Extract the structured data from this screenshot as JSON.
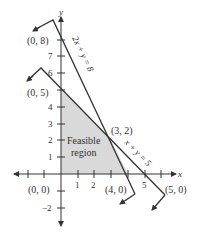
{
  "figure": {
    "axes": {
      "x_label": "x",
      "y_label": "y",
      "x_ticks": [
        "1",
        "2",
        "5"
      ],
      "y_ticks": [
        "−2",
        "1",
        "2",
        "3",
        "4",
        "6",
        "7"
      ]
    },
    "lines": [
      {
        "equation": "2x + y = 8",
        "intercepts": [
          "(0, 8)",
          "(4, 0)"
        ]
      },
      {
        "equation": "x + y = 5",
        "intercepts": [
          "(0, 5)",
          "(5, 0)"
        ]
      }
    ],
    "points": {
      "p08": "(0, 8)",
      "p05": "(0, 5)",
      "p32": "(3, 2)",
      "p40": "(4, 0)",
      "p50": "(5, 0)",
      "p00": "(0, 0)"
    },
    "region": {
      "line1": "Feasible",
      "line2": "region",
      "vertices": [
        "(0, 0)",
        "(0, 5)",
        "(3, 2)",
        "(4, 0)"
      ]
    },
    "colors": {
      "line": "#333333",
      "region_fill": "#d9d9d9",
      "background": "#ffffff"
    }
  }
}
